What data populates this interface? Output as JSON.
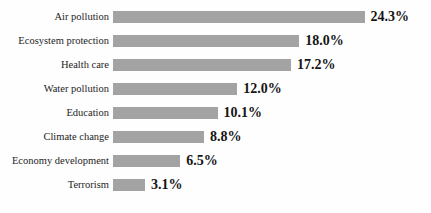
{
  "chart_data": {
    "type": "bar",
    "orientation": "horizontal",
    "title": "",
    "xlabel": "",
    "ylabel": "",
    "grid": false,
    "legend": null,
    "xlim": [
      0,
      24.3
    ],
    "value_suffix": "%",
    "bar_color": "#a3a3a3",
    "text_color": "#151515",
    "background_color": "#fefefe",
    "categories": [
      "Air pollution",
      "Ecosystem protection",
      "Health care",
      "Water pollution",
      "Education",
      "Climate change",
      "Economy development",
      "Terrorism"
    ],
    "values": [
      24.3,
      18.0,
      17.2,
      12.0,
      10.1,
      8.8,
      6.5,
      3.1
    ],
    "value_labels": [
      "24.3%",
      "18.0%",
      "17.2%",
      "12.0%",
      "10.1%",
      "8.8%",
      "6.5%",
      "3.1%"
    ],
    "bars": [
      {
        "label": "Air pollution",
        "value": 24.3,
        "value_label": "24.3%"
      },
      {
        "label": "Ecosystem protection",
        "value": 18.0,
        "value_label": "18.0%"
      },
      {
        "label": "Health care",
        "value": 17.2,
        "value_label": "17.2%"
      },
      {
        "label": "Water pollution",
        "value": 12.0,
        "value_label": "12.0%"
      },
      {
        "label": "Education",
        "value": 10.1,
        "value_label": "10.1%"
      },
      {
        "label": "Climate change",
        "value": 8.8,
        "value_label": "8.8%"
      },
      {
        "label": "Economy development",
        "value": 6.5,
        "value_label": "6.5%"
      },
      {
        "label": "Terrorism",
        "value": 3.1,
        "value_label": "3.1%"
      }
    ]
  }
}
